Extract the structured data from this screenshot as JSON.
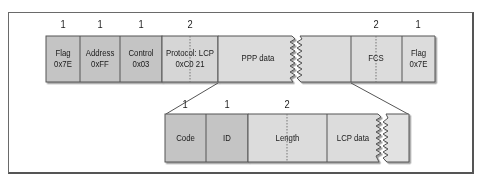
{
  "colors": {
    "dark": "#c6c6c6",
    "light": "#dcdcdc",
    "border": "#555555",
    "lightest": "#e4e4e4"
  },
  "ppp_frame": {
    "fields": [
      {
        "name": "Flag",
        "value": "0x7E",
        "size": "1"
      },
      {
        "name": "Address",
        "value": "0xFF",
        "size": "1"
      },
      {
        "name": "Control",
        "value": "0x03",
        "size": "1"
      },
      {
        "name": "Protocol: LCP",
        "value": "0xC0 21",
        "size": "2"
      },
      {
        "name": "PPP data",
        "value": "",
        "size": ""
      },
      {
        "name": "FCS",
        "value": "",
        "size": "2"
      },
      {
        "name": "Flag",
        "value": "0x7E",
        "size": "1"
      }
    ]
  },
  "lcp_frame": {
    "fields": [
      {
        "name": "Code",
        "size": "1"
      },
      {
        "name": "ID",
        "size": "1"
      },
      {
        "name": "Length",
        "size": "2"
      },
      {
        "name": "LCP data",
        "size": ""
      }
    ]
  }
}
